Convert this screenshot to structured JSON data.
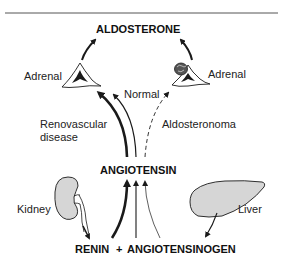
{
  "diagram": {
    "nodes": {
      "aldosterone": "ALDOSTERONE",
      "angiotensin": "ANGIOTENSIN",
      "renin": "RENIN",
      "plus": "+",
      "angiotensinogen": "ANGIOTENSINOGEN"
    },
    "organs": {
      "adrenal_left": "Adrenal",
      "adrenal_right": "Adrenal",
      "kidney": "Kidney",
      "liver": "Liver"
    },
    "pathway_labels": {
      "normal": "Normal",
      "renovascular_line1": "Renovascular",
      "renovascular_line2": "disease",
      "aldosteronoma": "Aldosteronoma"
    },
    "icons": [
      "adrenal-gland-icon",
      "adrenal-gland-with-tumor-icon",
      "kidney-icon",
      "liver-icon"
    ],
    "colors": {
      "stroke": "#1a1a1a",
      "organ_fill": "#d6d6d6",
      "background": "#ffffff"
    }
  }
}
